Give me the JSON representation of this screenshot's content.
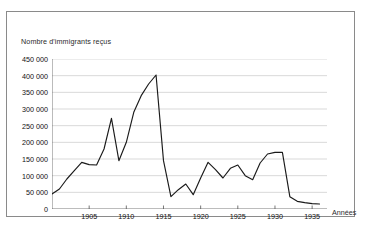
{
  "chart_data": {
    "type": "line",
    "title": "",
    "ylabel": "Nombre d'immigrants reçus",
    "xlabel": "Années",
    "xlim": [
      1900,
      1937
    ],
    "ylim": [
      0,
      450000
    ],
    "grid": "horizontal",
    "legend": "none",
    "ytick_labels": [
      "450 000",
      "400 000",
      "350 000",
      "300 000",
      "250 000",
      "200 000",
      "150 000",
      "100 000",
      "50 000",
      "0"
    ],
    "ytick_values": [
      450000,
      400000,
      350000,
      300000,
      250000,
      200000,
      150000,
      100000,
      50000,
      0
    ],
    "xtick_labels": [
      "1905",
      "1910",
      "1915",
      "1920",
      "1925",
      "1930",
      "1935"
    ],
    "xtick_values": [
      1905,
      1910,
      1915,
      1920,
      1925,
      1930,
      1935
    ],
    "line_color": "#1a1a1a",
    "grid_color": "#c8c8c8",
    "axis_color": "#555555",
    "x": [
      1900,
      1901,
      1902,
      1903,
      1904,
      1905,
      1906,
      1907,
      1908,
      1909,
      1910,
      1911,
      1912,
      1913,
      1914,
      1915,
      1916,
      1917,
      1918,
      1919,
      1920,
      1921,
      1922,
      1923,
      1924,
      1925,
      1926,
      1927,
      1928,
      1929,
      1930,
      1931,
      1932,
      1933,
      1934,
      1935,
      1936
    ],
    "values": [
      45000,
      60000,
      90000,
      115000,
      140000,
      133000,
      132000,
      180000,
      272000,
      145000,
      200000,
      290000,
      340000,
      375000,
      402000,
      145000,
      37000,
      58000,
      75000,
      43000,
      93000,
      140000,
      118000,
      93000,
      122000,
      132000,
      100000,
      88000,
      138000,
      165000,
      170000,
      170000,
      37000,
      23000,
      19000,
      16000,
      15000
    ]
  }
}
